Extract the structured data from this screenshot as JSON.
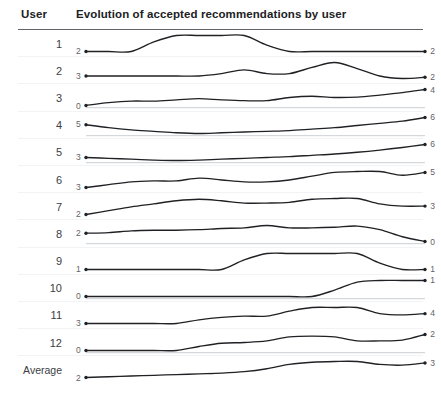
{
  "header": {
    "col_user": "User",
    "col_chart": "Evolution of accepted recommendations by user"
  },
  "chart_data": {
    "type": "line",
    "title": "Evolution of accepted recommendations by user",
    "xlabel": "",
    "ylabel": "Accepted recommendations",
    "grid": false,
    "legend_position": "none",
    "x": [
      0,
      1,
      2,
      3,
      4,
      5,
      6,
      7,
      8,
      9,
      10,
      11,
      12,
      13,
      14,
      15
    ],
    "series": [
      {
        "name": "1",
        "start_value": 2,
        "end_value": 2,
        "values": [
          2,
          2,
          2,
          2.6,
          3,
          3,
          3,
          3,
          2.4,
          2,
          2,
          2,
          2,
          2,
          2,
          2
        ]
      },
      {
        "name": "2",
        "start_value": 3,
        "end_value": 2,
        "values": [
          3,
          3,
          3,
          3,
          3,
          3,
          3.2,
          3.5,
          3.2,
          3.2,
          3.7,
          4.1,
          3.6,
          3,
          2.8,
          2.9
        ]
      },
      {
        "name": "3",
        "start_value": 0,
        "end_value": 4,
        "values": [
          0,
          0.7,
          1.1,
          1.1,
          1.4,
          1.7,
          1.4,
          1.2,
          1.2,
          2,
          2.3,
          2,
          2.1,
          2.6,
          3.2,
          4
        ]
      },
      {
        "name": "4",
        "start_value": 5,
        "end_value": 6,
        "values": [
          5,
          4.6,
          4.3,
          4.1,
          3.9,
          3.8,
          3.9,
          4,
          4.1,
          4.2,
          4.4,
          4.6,
          4.9,
          5.2,
          5.5,
          6
        ]
      },
      {
        "name": "5",
        "start_value": 3,
        "end_value": 6,
        "values": [
          3,
          2.8,
          2.6,
          2.4,
          2.3,
          2.4,
          2.6,
          2.8,
          3,
          3.2,
          3.5,
          3.8,
          4.2,
          4.7,
          5.3,
          6
        ]
      },
      {
        "name": "6",
        "start_value": 3,
        "end_value": 5,
        "values": [
          3,
          3.3,
          3.6,
          3.7,
          3.7,
          4,
          3.8,
          3.6,
          3.6,
          3.8,
          4.2,
          4.6,
          4.7,
          4.7,
          4.3,
          4.6
        ]
      },
      {
        "name": "7",
        "start_value": 2,
        "end_value": 3,
        "values": [
          2,
          2.5,
          3,
          3.4,
          3.8,
          4,
          3.8,
          3.5,
          3.5,
          3.6,
          4,
          4.1,
          4.1,
          3.4,
          3.1,
          3.1
        ]
      },
      {
        "name": "8",
        "start_value": 2,
        "end_value": 0,
        "values": [
          2,
          2.1,
          2.4,
          2.5,
          2.5,
          2.6,
          2.8,
          2.9,
          3.3,
          2.9,
          2.9,
          3,
          3.2,
          2.6,
          1.4,
          0.6
        ]
      },
      {
        "name": "9",
        "start_value": 1,
        "end_value": 1,
        "values": [
          1,
          1,
          1,
          1,
          1,
          1,
          1,
          1.6,
          2,
          2,
          2,
          2,
          2,
          1.4,
          1,
          1
        ]
      },
      {
        "name": "10",
        "start_value": 0,
        "end_value": 1,
        "values": [
          0,
          0,
          0,
          0,
          0,
          0,
          0,
          0,
          0,
          0,
          0,
          0.4,
          0.9,
          1,
          1,
          1
        ]
      },
      {
        "name": "11",
        "start_value": 3,
        "end_value": 4,
        "values": [
          3,
          3,
          3,
          3,
          3,
          3.3,
          3.5,
          3.6,
          3.6,
          4,
          4.3,
          4.3,
          4.3,
          3.8,
          3.7,
          3.8
        ]
      },
      {
        "name": "12",
        "start_value": 0,
        "end_value": 2,
        "values": [
          0,
          0,
          0,
          0,
          0,
          0.5,
          0.9,
          1,
          1.2,
          1.7,
          1.8,
          1.7,
          1.2,
          1.2,
          1.3,
          2
        ]
      },
      {
        "name": "Average",
        "start_value": 2,
        "end_value": 3,
        "values": [
          2,
          2.05,
          2.1,
          2.15,
          2.2,
          2.25,
          2.3,
          2.4,
          2.6,
          2.9,
          3.05,
          3.1,
          3.1,
          2.9,
          2.85,
          3
        ]
      }
    ]
  },
  "style": {
    "line_color": "#202124",
    "baseline_color": "#bdc1c6",
    "separator_color": "#f1f3f4",
    "header_rule_color": "#5f6368",
    "value_label_color": "#5f6368",
    "background": "#ffffff"
  },
  "baseline_rows": [
    "3",
    "4",
    "5",
    "8",
    "10",
    "12"
  ]
}
